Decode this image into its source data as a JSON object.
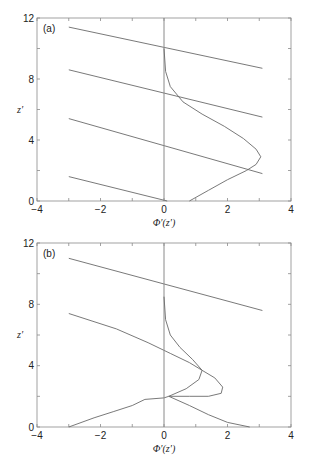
{
  "chart_data": [
    {
      "type": "line",
      "panel_label": "(a)",
      "xlabel": "Φ′(z′)",
      "ylabel": "z′",
      "xlim": [
        -4,
        4
      ],
      "ylim": [
        0,
        12
      ],
      "xticks": [
        -4,
        -2,
        0,
        2,
        4
      ],
      "yticks": [
        0,
        4,
        8,
        12
      ],
      "grid": false,
      "series": [
        {
          "name": "line-1",
          "x": [
            -3,
            3.1
          ],
          "y": [
            11.4,
            8.7
          ]
        },
        {
          "name": "line-2",
          "x": [
            -3,
            3.1
          ],
          "y": [
            8.6,
            5.5
          ]
        },
        {
          "name": "line-3",
          "x": [
            -3,
            3.1
          ],
          "y": [
            5.4,
            1.8
          ]
        },
        {
          "name": "line-4",
          "x": [
            -3,
            0.1
          ],
          "y": [
            1.6,
            0
          ]
        },
        {
          "name": "vertical-axis-zero",
          "x": [
            0,
            0
          ],
          "y": [
            0,
            12
          ]
        },
        {
          "name": "profile",
          "x": [
            0.0,
            0.05,
            0.2,
            0.6,
            1.2,
            1.9,
            2.5,
            2.9,
            3.05,
            2.9,
            2.6,
            2.0,
            1.4,
            0.8
          ],
          "y": [
            10.0,
            8.5,
            7.5,
            6.5,
            5.7,
            4.9,
            4.1,
            3.4,
            2.9,
            2.4,
            2.0,
            1.4,
            0.7,
            0.0
          ]
        }
      ]
    },
    {
      "type": "line",
      "panel_label": "(b)",
      "xlabel": "Φ′(z′)",
      "ylabel": "z′",
      "xlim": [
        -4,
        4
      ],
      "ylim": [
        0,
        12
      ],
      "xticks": [
        -4,
        -2,
        0,
        2,
        4
      ],
      "yticks": [
        0,
        4,
        8,
        12
      ],
      "grid": false,
      "series": [
        {
          "name": "line-1",
          "x": [
            -3,
            3.1
          ],
          "y": [
            11.0,
            7.6
          ]
        },
        {
          "name": "line-2",
          "x": [
            -3,
            -1.5,
            -0.5,
            0.2,
            0.8,
            1.2,
            1.6,
            1.85,
            1.8,
            1.4,
            0.8,
            0.15
          ],
          "y": [
            7.4,
            6.4,
            5.5,
            4.8,
            4.2,
            3.7,
            3.2,
            2.6,
            2.2,
            2.0,
            2.0,
            2.0
          ]
        },
        {
          "name": "line-3",
          "x": [
            -3,
            -2.2,
            -1.6,
            -1.0,
            -0.6,
            0.0,
            0.15,
            0.8,
            1.4,
            2.0,
            2.7
          ],
          "y": [
            0.0,
            0.6,
            1.0,
            1.4,
            1.8,
            1.9,
            2.0,
            1.4,
            0.8,
            0.3,
            0.0
          ]
        },
        {
          "name": "vertical-axis-zero",
          "x": [
            0,
            0
          ],
          "y": [
            0,
            12
          ]
        },
        {
          "name": "profile",
          "x": [
            0.0,
            0.05,
            0.2,
            0.5,
            0.9,
            1.2,
            1.1,
            0.7,
            0.15
          ],
          "y": [
            8.5,
            7.0,
            6.0,
            5.2,
            4.4,
            3.7,
            3.1,
            2.5,
            2.0
          ]
        }
      ]
    }
  ],
  "panels": [
    {
      "label": "(a)",
      "xlabel_main": "Φ",
      "xlabel_rest": "′(z′)",
      "ylabel": "z′",
      "xtick_labels": [
        "−4",
        "−2",
        "0",
        "2",
        "4"
      ],
      "ytick_labels": [
        "0",
        "4",
        "8",
        "12"
      ]
    },
    {
      "label": "(b)",
      "xlabel_main": "Φ",
      "xlabel_rest": "′(z′)",
      "ylabel": "z′",
      "xtick_labels": [
        "−4",
        "−2",
        "0",
        "2",
        "4"
      ],
      "ytick_labels": [
        "0",
        "4",
        "8",
        "12"
      ]
    }
  ],
  "colors": {
    "line": "#6a6a6a",
    "axis": "#8a8a8a",
    "text": "#222222"
  }
}
